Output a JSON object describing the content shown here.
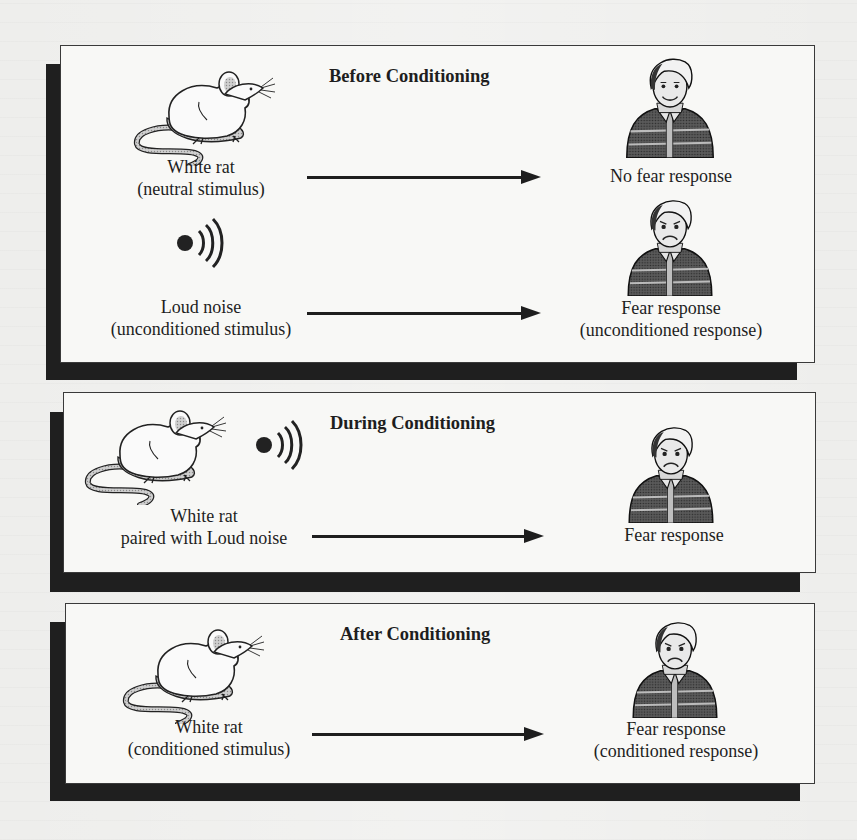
{
  "diagram": {
    "type": "classical-conditioning",
    "panels": [
      {
        "id": "before",
        "title": "Before Conditioning",
        "rows": [
          {
            "stimulus_icon": "rat-icon",
            "stimulus_line1": "White rat",
            "stimulus_line2": "(neutral stimulus)",
            "response_icon": "calm-boy-icon",
            "response_line1": "No fear response",
            "response_line2": ""
          },
          {
            "stimulus_icon": "loud-noise-icon",
            "stimulus_line1": "Loud noise",
            "stimulus_line2": "(unconditioned stimulus)",
            "response_icon": "fearful-boy-icon",
            "response_line1": "Fear response",
            "response_line2": "(unconditioned response)"
          }
        ]
      },
      {
        "id": "during",
        "title": "During Conditioning",
        "rows": [
          {
            "stimulus_icon": "rat-with-noise-icon",
            "stimulus_line1": "White rat",
            "stimulus_line2": "paired with Loud noise",
            "response_icon": "fearful-boy-icon",
            "response_line1": "Fear response",
            "response_line2": ""
          }
        ]
      },
      {
        "id": "after",
        "title": "After Conditioning",
        "rows": [
          {
            "stimulus_icon": "rat-icon",
            "stimulus_line1": "White rat",
            "stimulus_line2": "(conditioned stimulus)",
            "response_icon": "fearful-boy-icon",
            "response_line1": "Fear response",
            "response_line2": "(conditioned response)"
          }
        ]
      }
    ]
  },
  "colors": {
    "page": "#eeeeec",
    "panel": "#f8f8f6",
    "shadow": "#1f1f1f",
    "ink": "#1e1e1e",
    "rat_shade": "#bdbdbd",
    "shirt": "#4a4a4a"
  }
}
